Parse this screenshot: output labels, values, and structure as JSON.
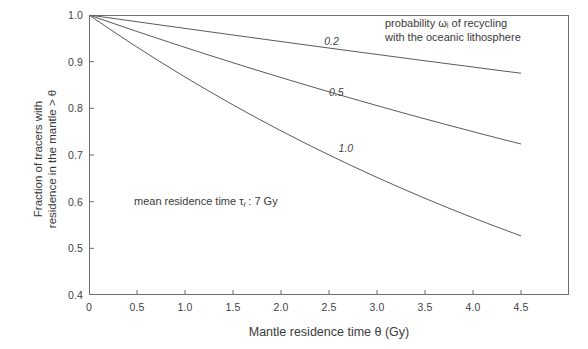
{
  "chart_data": {
    "type": "line",
    "title": "",
    "xlabel": "Mantle residence time θ (Gy)",
    "ylabel_line1": "Fraction of tracers with",
    "ylabel_line2": "residence in the mantle > θ",
    "xlim": [
      0,
      5.0
    ],
    "ylim": [
      0.4,
      1.0
    ],
    "xticks": [
      "0",
      "0.5",
      "1.0",
      "1.5",
      "2.0",
      "2.5",
      "3.0",
      "3.5",
      "4.0",
      "4.5"
    ],
    "xtick_values": [
      0,
      0.5,
      1.0,
      1.5,
      2.0,
      2.5,
      3.0,
      3.5,
      4.0,
      4.5
    ],
    "yticks": [
      "0.4",
      "0.5",
      "0.6",
      "0.7",
      "0.8",
      "0.9",
      "1.0"
    ],
    "ytick_values": [
      0.4,
      0.5,
      0.6,
      0.7,
      0.8,
      0.9,
      1.0
    ],
    "grid": false,
    "legend": "none",
    "line_color": "#5a5a5a",
    "axis_color": "#6e6e6e",
    "x": [
      0,
      0.25,
      0.5,
      0.75,
      1.0,
      1.25,
      1.5,
      1.75,
      2.0,
      2.25,
      2.5,
      2.75,
      3.0,
      3.25,
      3.5,
      3.75,
      4.0,
      4.25,
      4.5
    ],
    "series": [
      {
        "name": "0.2",
        "label": "0.2",
        "label_x": 2.45,
        "label_y": 0.942,
        "values": [
          1.0,
          0.9928,
          0.9856,
          0.9784,
          0.9713,
          0.9642,
          0.9571,
          0.9501,
          0.9431,
          0.9361,
          0.9292,
          0.9223,
          0.9155,
          0.9087,
          0.9019,
          0.8952,
          0.8885,
          0.8818,
          0.8752
        ]
      },
      {
        "name": "0.5",
        "label": "0.5",
        "label_x": 2.5,
        "label_y": 0.832,
        "values": [
          1.0,
          0.9822,
          0.9647,
          0.9475,
          0.9306,
          0.914,
          0.8977,
          0.8817,
          0.866,
          0.8506,
          0.8354,
          0.8205,
          0.8059,
          0.7915,
          0.7774,
          0.7636,
          0.75,
          0.7366,
          0.7235
        ]
      },
      {
        "name": "1.0",
        "label": "1.0",
        "label_x": 2.6,
        "label_y": 0.712,
        "values": [
          1.0,
          0.965,
          0.9312,
          0.8986,
          0.8671,
          0.8367,
          0.8074,
          0.7791,
          0.7518,
          0.7255,
          0.7001,
          0.6756,
          0.652,
          0.6292,
          0.6072,
          0.5859,
          0.5655,
          0.5457,
          0.5266
        ]
      }
    ],
    "annotations": {
      "recycling_line1": "probability ωᵢ of recycling",
      "recycling_line2": "with the oceanic lithosphere",
      "recycling_text": "probability ωi of recycling with the oceanic lithosphere",
      "residence_prefix": "mean residence time τ",
      "residence_sub": "i",
      "residence_suffix": " : 7 Gy",
      "residence_text": "mean residence time τi : 7 Gy"
    }
  }
}
